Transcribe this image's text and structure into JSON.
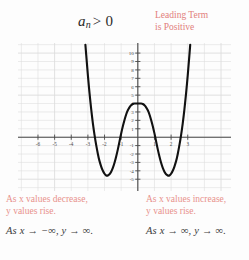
{
  "header": {
    "expression_var": "a",
    "expression_sub": "n",
    "expression_rel": "> 0",
    "leading_term_line1": "Leading Term",
    "leading_term_line2": "is Positive",
    "leading_term_color": "#e2807c"
  },
  "notes": {
    "left": {
      "prose_line1": "As x values decrease,",
      "prose_line2": "y values rise.",
      "limit": "As x → −∞, y → ∞."
    },
    "right": {
      "prose_line1": "As x values increase,",
      "prose_line2": "y values rise.",
      "limit": "As x → ∞, y → ∞."
    },
    "prose_color": "#e8918c",
    "limit_color": "#3a3a3a"
  },
  "chart_data": {
    "type": "line",
    "title": "",
    "xlabel": "",
    "ylabel": "",
    "xlim": [
      -7.2,
      5.6
    ],
    "ylim": [
      -6.4,
      11.2
    ],
    "grid": true,
    "grid_color": "#dcdcdc",
    "axis_color": "#4a4a4a",
    "curve_color": "#111111",
    "curve_width": 2.1,
    "legend": "none",
    "x_ticks": [
      -6,
      -5,
      -4,
      -3,
      -2,
      -1,
      1,
      2,
      3
    ],
    "x_tick_labels": [
      "-6",
      "-5",
      "-4",
      "-3",
      "-2",
      "-1",
      "1",
      "2",
      "3"
    ],
    "y_ticks": [
      -5,
      -4,
      -3,
      -2,
      -1,
      1,
      2,
      3,
      4,
      5,
      6,
      7,
      8,
      9,
      10
    ],
    "y_tick_labels": [
      "-5",
      "-4",
      "-3",
      "-2",
      "-1",
      "1",
      "2",
      "3",
      "4",
      "5",
      "6",
      "7",
      "8",
      "9",
      "10"
    ],
    "series": [
      {
        "name": "quartic",
        "description": "Even-degree polynomial, positive leading coefficient, W-shaped",
        "local_max": [
          0,
          4
        ],
        "local_minima": [
          [
            -2,
            -5
          ],
          [
            2,
            -5
          ]
        ],
        "x_intercepts": [
          -2.8,
          -1.1,
          1.1,
          2.8
        ],
        "x": [
          -3.15,
          -3.05,
          -2.95,
          -2.85,
          -2.75,
          -2.65,
          -2.55,
          -2.45,
          -2.35,
          -2.25,
          -2.15,
          -2.05,
          -1.95,
          -1.85,
          -1.75,
          -1.65,
          -1.55,
          -1.45,
          -1.35,
          -1.25,
          -1.15,
          -1.05,
          -0.95,
          -0.85,
          -0.75,
          -0.65,
          -0.55,
          -0.45,
          -0.35,
          -0.25,
          -0.15,
          -0.05,
          0.05,
          0.15,
          0.25,
          0.35,
          0.45,
          0.55,
          0.65,
          0.75,
          0.85,
          0.95,
          1.05,
          1.15,
          1.25,
          1.35,
          1.45,
          1.55,
          1.65,
          1.75,
          1.85,
          1.95,
          2.05,
          2.15,
          2.25,
          2.35,
          2.45,
          2.55,
          2.65,
          2.75,
          2.85,
          2.95,
          3.05,
          3.15
        ],
        "y": [
          11.0,
          8.5,
          6.2,
          4.2,
          2.4,
          0.9,
          -0.4,
          -1.5,
          -2.5,
          -3.2,
          -3.8,
          -4.2,
          -4.5,
          -4.6,
          -4.5,
          -4.3,
          -3.9,
          -3.4,
          -2.7,
          -1.9,
          -1.0,
          0.0,
          0.9,
          1.7,
          2.4,
          3.0,
          3.4,
          3.7,
          3.9,
          4.0,
          4.0,
          4.0,
          4.0,
          4.0,
          4.0,
          3.9,
          3.7,
          3.4,
          3.0,
          2.4,
          1.7,
          0.9,
          0.0,
          -1.0,
          -1.9,
          -2.7,
          -3.4,
          -3.9,
          -4.3,
          -4.5,
          -4.6,
          -4.5,
          -4.2,
          -3.8,
          -3.2,
          -2.5,
          -1.5,
          -0.4,
          0.9,
          2.4,
          4.2,
          6.2,
          8.5,
          11.0
        ]
      }
    ]
  }
}
